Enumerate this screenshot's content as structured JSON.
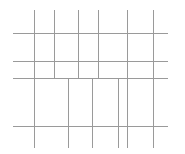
{
  "canvas": {
    "width": 185,
    "height": 154,
    "background_color": "#ffffff",
    "title": "Irregular Grid Line Drawing"
  },
  "style": {
    "line_color": "#9a9a9a",
    "line_color_light": "#b4b4b4",
    "line_width": 1.1
  },
  "chart_data": {
    "type": "line",
    "xlabel": "",
    "ylabel": "",
    "xlim": [
      0,
      185
    ],
    "ylim": [
      0,
      154
    ],
    "grid": false,
    "legend": "none",
    "segments": [
      {
        "id": "v1",
        "orientation": "vertical",
        "x": 34,
        "y1": 10,
        "y2": 148
      },
      {
        "id": "v2",
        "orientation": "vertical",
        "x": 54,
        "y1": 10,
        "y2": 78
      },
      {
        "id": "v3",
        "orientation": "vertical",
        "x": 78,
        "y1": 10,
        "y2": 78
      },
      {
        "id": "v4",
        "orientation": "vertical",
        "x": 98,
        "y1": 10,
        "y2": 78
      },
      {
        "id": "v5",
        "orientation": "vertical",
        "x": 127,
        "y1": 10,
        "y2": 78
      },
      {
        "id": "v6",
        "orientation": "vertical",
        "x": 153,
        "y1": 10,
        "y2": 148
      },
      {
        "id": "v7",
        "orientation": "vertical",
        "x": 68,
        "y1": 78,
        "y2": 148
      },
      {
        "id": "v8",
        "orientation": "vertical",
        "x": 92,
        "y1": 78,
        "y2": 148
      },
      {
        "id": "v9",
        "orientation": "vertical",
        "x": 118,
        "y1": 78,
        "y2": 148
      },
      {
        "id": "v10",
        "orientation": "vertical",
        "x": 127,
        "y1": 78,
        "y2": 148
      },
      {
        "id": "h1",
        "orientation": "horizontal",
        "y": 33,
        "x1": 13,
        "x2": 168
      },
      {
        "id": "h2",
        "orientation": "horizontal",
        "y": 61,
        "x1": 13,
        "x2": 168
      },
      {
        "id": "h3",
        "orientation": "horizontal",
        "y": 78,
        "x1": 13,
        "x2": 168
      },
      {
        "id": "h4",
        "orientation": "horizontal",
        "y": 126,
        "x1": 13,
        "x2": 168
      }
    ]
  }
}
